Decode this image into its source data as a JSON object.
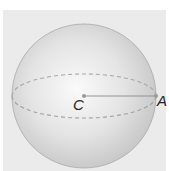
{
  "diagram": {
    "type": "sphere",
    "labels": {
      "center": "C",
      "point": "A"
    },
    "elements": [
      {
        "kind": "sphere",
        "description": "shaded sphere"
      },
      {
        "kind": "equator",
        "style": "dashed ellipse"
      },
      {
        "kind": "radius",
        "from": "C",
        "to": "A"
      }
    ],
    "colors": {
      "background": "#ebebeb",
      "sphere_light": "#fafafa",
      "sphere_dark": "#c4c4c4",
      "outline": "#a8a8a8",
      "equator": "#a0a0a0",
      "radius_line": "#8a8a8a",
      "label": "#222222"
    }
  }
}
